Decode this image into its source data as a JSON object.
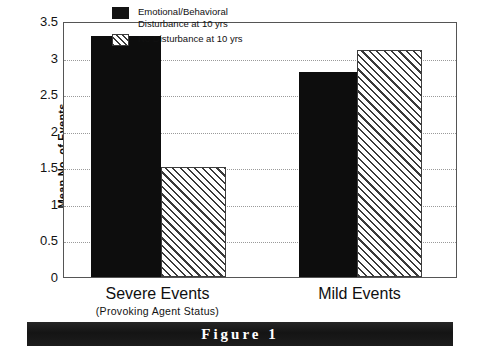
{
  "figure": {
    "caption": "Figure 1"
  },
  "chart_data": {
    "type": "bar",
    "title": "",
    "xlabel": "",
    "ylabel": "Mean No. of Events",
    "categories": [
      "Severe Events",
      "Mild Events"
    ],
    "category_sublabels": [
      "(Provoking Agent Status)",
      ""
    ],
    "series": [
      {
        "name": "Emotional/Behavioral\nDisturbance at 10 yrs",
        "style": "solid-black",
        "color": "#0d0d0d",
        "values": [
          3.3,
          2.8
        ]
      },
      {
        "name": "No Disturbance at 10 yrs",
        "style": "diagonal-hatch",
        "color": "#3a3a3a",
        "values": [
          1.5,
          3.1
        ]
      }
    ],
    "ylim": [
      0,
      3.5
    ],
    "yticks": [
      0,
      0.5,
      1,
      1.5,
      2,
      2.5,
      3,
      3.5
    ],
    "ytick_labels": [
      "0",
      "0.5",
      "1",
      "1.5",
      "2",
      "2.5",
      "3",
      "3.5"
    ],
    "grid": true,
    "grid_style": "dotted",
    "legend_position": "top-center-inside"
  }
}
